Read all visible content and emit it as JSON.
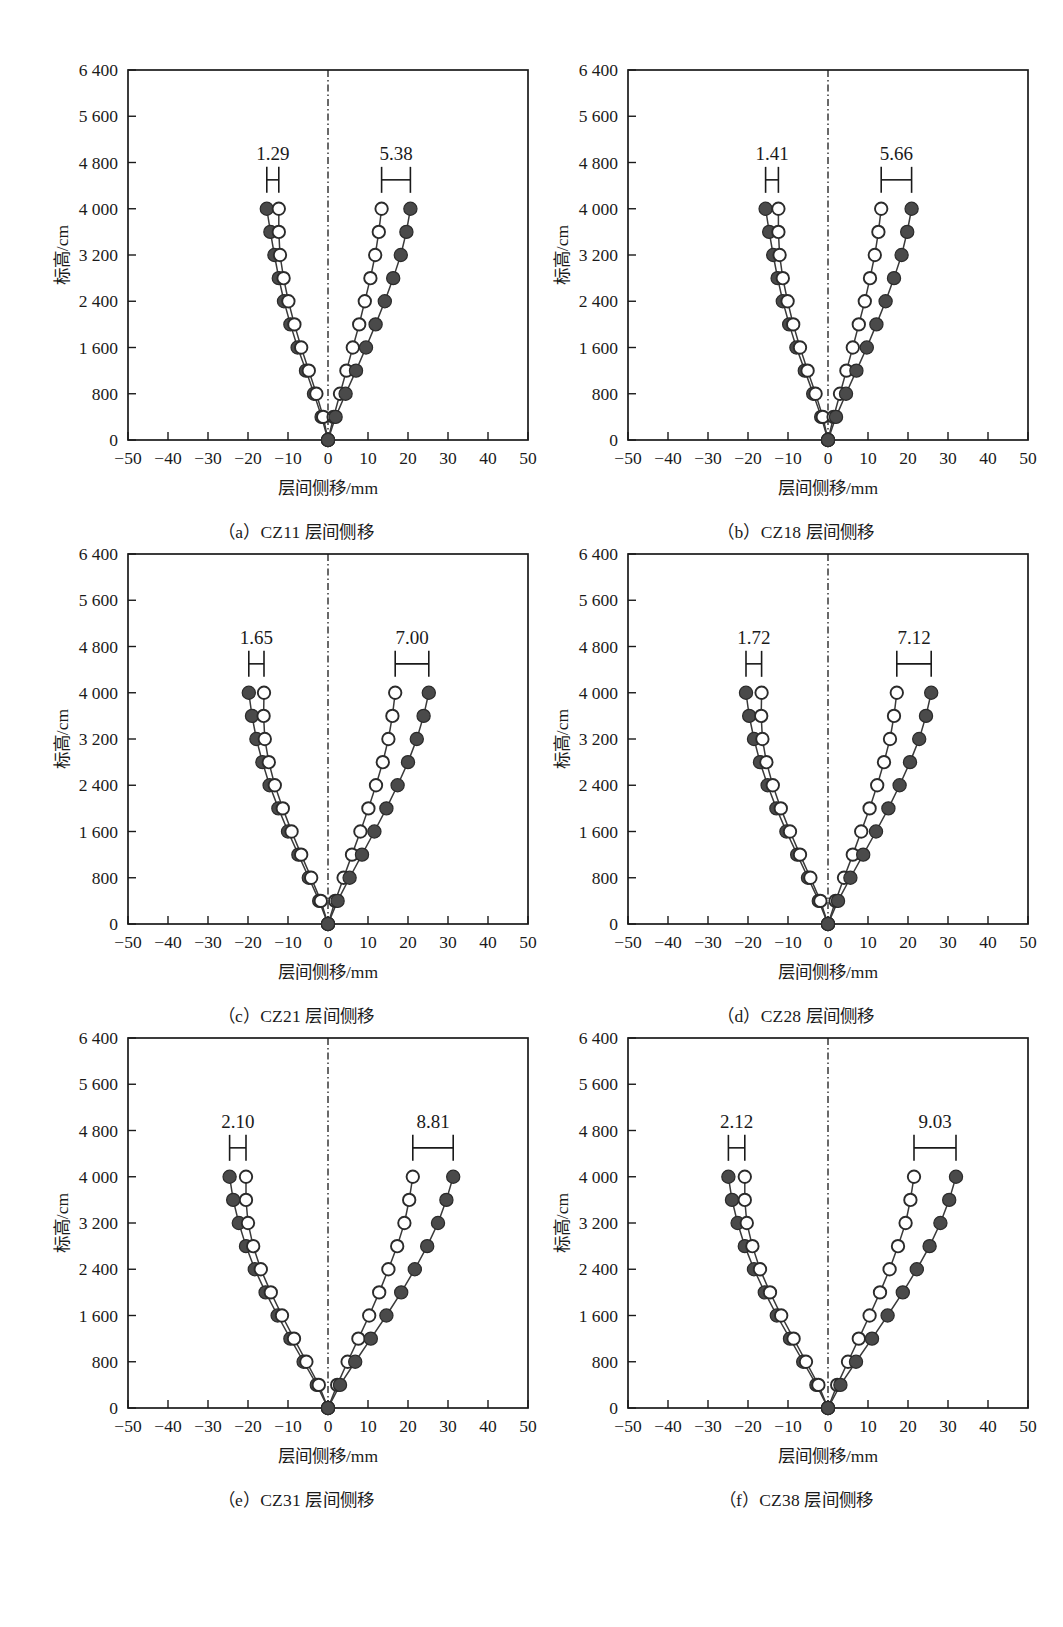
{
  "figure": {
    "axis": {
      "xlabel": "层间侧移/mm",
      "ylabel": "标高/cm",
      "xticks": [
        "−50",
        "−40",
        "−30",
        "−20",
        "−10",
        "0",
        "10",
        "20",
        "30",
        "40",
        "50"
      ],
      "xtickvals": [
        -50,
        -40,
        -30,
        -20,
        -10,
        0,
        10,
        20,
        30,
        40,
        50
      ],
      "yticks": [
        "0",
        "800",
        "1 600",
        "2 400",
        "3 200",
        "4 000",
        "4 800",
        "5 600",
        "6 400"
      ],
      "ytickvals": [
        0,
        800,
        1600,
        2400,
        3200,
        4000,
        4800,
        5600,
        6400
      ],
      "xlim": [
        -50,
        50
      ],
      "ylim": [
        0,
        6400
      ]
    },
    "panels": [
      {
        "key": "a",
        "caption": "（a）CZ11 层间侧移"
      },
      {
        "key": "b",
        "caption": "（b）CZ18 层间侧移"
      },
      {
        "key": "c",
        "caption": "（c）CZ21 层间侧移"
      },
      {
        "key": "d",
        "caption": "（d）CZ28 层间侧移"
      },
      {
        "key": "e",
        "caption": "（e）CZ31 层间侧移"
      },
      {
        "key": "f",
        "caption": "（f）CZ38 层间侧移"
      }
    ]
  },
  "chart_data": [
    {
      "type": "line",
      "panel": "a",
      "title": "（a）CZ11 层间侧移",
      "xlabel": "层间侧移/mm",
      "ylabel": "标高/cm",
      "xlim": [
        -50,
        50
      ],
      "ylim": [
        0,
        6400
      ],
      "grid": false,
      "legend": "none",
      "elevations": [
        0,
        400,
        800,
        1200,
        1600,
        2000,
        2400,
        2800,
        3200,
        3600,
        4000
      ],
      "annotations": [
        {
          "label": "1.29",
          "side": "left",
          "x_from": -15.3,
          "x_to": -12.3,
          "y": 4500
        },
        {
          "label": "5.38",
          "side": "right",
          "x_from": 13.4,
          "x_to": 20.6,
          "y": 4500
        }
      ],
      "series": [
        {
          "name": "filled-negative",
          "marker": "filled",
          "x": [
            0,
            -1.6,
            -3.5,
            -5.5,
            -7.6,
            -9.4,
            -11.0,
            -12.3,
            -13.4,
            -14.4,
            -15.3
          ],
          "y": [
            0,
            400,
            800,
            1200,
            1600,
            2000,
            2400,
            2800,
            3200,
            3600,
            4000
          ]
        },
        {
          "name": "hollow-negative",
          "marker": "hollow",
          "x": [
            0,
            -1.2,
            -2.9,
            -4.8,
            -6.7,
            -8.4,
            -9.9,
            -11.1,
            -12.0,
            -12.3,
            -12.3
          ],
          "y": [
            0,
            400,
            800,
            1200,
            1600,
            2000,
            2400,
            2800,
            3200,
            3600,
            4000
          ]
        },
        {
          "name": "hollow-positive",
          "marker": "hollow",
          "x": [
            0,
            1.4,
            3.0,
            4.6,
            6.2,
            7.8,
            9.2,
            10.6,
            11.8,
            12.7,
            13.4
          ],
          "y": [
            0,
            400,
            800,
            1200,
            1600,
            2000,
            2400,
            2800,
            3200,
            3600,
            4000
          ]
        },
        {
          "name": "filled-positive",
          "marker": "filled",
          "x": [
            0,
            1.9,
            4.4,
            7.0,
            9.5,
            11.9,
            14.2,
            16.3,
            18.2,
            19.6,
            20.6
          ],
          "y": [
            0,
            400,
            800,
            1200,
            1600,
            2000,
            2400,
            2800,
            3200,
            3600,
            4000
          ]
        }
      ]
    },
    {
      "type": "line",
      "panel": "b",
      "title": "（b）CZ18 层间侧移",
      "xlabel": "层间侧移/mm",
      "ylabel": "标高/cm",
      "xlim": [
        -50,
        50
      ],
      "ylim": [
        0,
        6400
      ],
      "grid": false,
      "legend": "none",
      "elevations": [
        0,
        400,
        800,
        1200,
        1600,
        2000,
        2400,
        2800,
        3200,
        3600,
        4000
      ],
      "annotations": [
        {
          "label": "1.41",
          "side": "left",
          "x_from": -15.6,
          "x_to": -12.4,
          "y": 4500
        },
        {
          "label": "5.66",
          "side": "right",
          "x_from": 13.3,
          "x_to": 20.9,
          "y": 4500
        }
      ],
      "series": [
        {
          "name": "filled-negative",
          "marker": "filled",
          "x": [
            0,
            -1.7,
            -3.7,
            -5.8,
            -7.9,
            -9.7,
            -11.3,
            -12.6,
            -13.7,
            -14.7,
            -15.6
          ],
          "y": [
            0,
            400,
            800,
            1200,
            1600,
            2000,
            2400,
            2800,
            3200,
            3600,
            4000
          ]
        },
        {
          "name": "hollow-negative",
          "marker": "hollow",
          "x": [
            0,
            -1.3,
            -3.1,
            -5.1,
            -7.0,
            -8.7,
            -10.1,
            -11.3,
            -12.1,
            -12.4,
            -12.4
          ],
          "y": [
            0,
            400,
            800,
            1200,
            1600,
            2000,
            2400,
            2800,
            3200,
            3600,
            4000
          ]
        },
        {
          "name": "hollow-positive",
          "marker": "hollow",
          "x": [
            0,
            1.4,
            3.0,
            4.6,
            6.2,
            7.7,
            9.2,
            10.5,
            11.7,
            12.6,
            13.3
          ],
          "y": [
            0,
            400,
            800,
            1200,
            1600,
            2000,
            2400,
            2800,
            3200,
            3600,
            4000
          ]
        },
        {
          "name": "filled-positive",
          "marker": "filled",
          "x": [
            0,
            2.0,
            4.5,
            7.1,
            9.7,
            12.1,
            14.4,
            16.5,
            18.4,
            19.8,
            20.9
          ],
          "y": [
            0,
            400,
            800,
            1200,
            1600,
            2000,
            2400,
            2800,
            3200,
            3600,
            4000
          ]
        }
      ]
    },
    {
      "type": "line",
      "panel": "c",
      "title": "（c）CZ21 层间侧移",
      "xlabel": "层间侧移/mm",
      "ylabel": "标高/cm",
      "xlim": [
        -50,
        50
      ],
      "ylim": [
        0,
        6400
      ],
      "grid": false,
      "legend": "none",
      "elevations": [
        0,
        400,
        800,
        1200,
        1600,
        2000,
        2400,
        2800,
        3200,
        3600,
        4000
      ],
      "annotations": [
        {
          "label": "1.65",
          "side": "left",
          "x_from": -19.8,
          "x_to": -16.0,
          "y": 4500
        },
        {
          "label": "7.00",
          "side": "right",
          "x_from": 16.8,
          "x_to": 25.2,
          "y": 4500
        }
      ],
      "series": [
        {
          "name": "filled-negative",
          "marker": "filled",
          "x": [
            0,
            -2.2,
            -4.8,
            -7.4,
            -10.0,
            -12.4,
            -14.6,
            -16.4,
            -17.9,
            -19.0,
            -19.8
          ],
          "y": [
            0,
            400,
            800,
            1200,
            1600,
            2000,
            2400,
            2800,
            3200,
            3600,
            4000
          ]
        },
        {
          "name": "hollow-negative",
          "marker": "hollow",
          "x": [
            0,
            -1.8,
            -4.2,
            -6.7,
            -9.1,
            -11.3,
            -13.3,
            -14.8,
            -15.8,
            -16.1,
            -16.0
          ],
          "y": [
            0,
            400,
            800,
            1200,
            1600,
            2000,
            2400,
            2800,
            3200,
            3600,
            4000
          ]
        },
        {
          "name": "hollow-positive",
          "marker": "hollow",
          "x": [
            0,
            1.8,
            3.9,
            6.0,
            8.1,
            10.1,
            12.0,
            13.7,
            15.1,
            16.1,
            16.8
          ],
          "y": [
            0,
            400,
            800,
            1200,
            1600,
            2000,
            2400,
            2800,
            3200,
            3600,
            4000
          ]
        },
        {
          "name": "filled-positive",
          "marker": "filled",
          "x": [
            0,
            2.4,
            5.4,
            8.5,
            11.6,
            14.6,
            17.4,
            20.0,
            22.2,
            23.9,
            25.2
          ],
          "y": [
            0,
            400,
            800,
            1200,
            1600,
            2000,
            2400,
            2800,
            3200,
            3600,
            4000
          ]
        }
      ]
    },
    {
      "type": "line",
      "panel": "d",
      "title": "（d）CZ28 层间侧移",
      "xlabel": "层间侧移/mm",
      "ylabel": "标高/cm",
      "xlim": [
        -50,
        50
      ],
      "ylim": [
        0,
        6400
      ],
      "grid": false,
      "legend": "none",
      "elevations": [
        0,
        400,
        800,
        1200,
        1600,
        2000,
        2400,
        2800,
        3200,
        3600,
        4000
      ],
      "annotations": [
        {
          "label": "1.72",
          "side": "left",
          "x_from": -20.5,
          "x_to": -16.6,
          "y": 4500
        },
        {
          "label": "7.12",
          "side": "right",
          "x_from": 17.2,
          "x_to": 25.8,
          "y": 4500
        }
      ],
      "series": [
        {
          "name": "filled-negative",
          "marker": "filled",
          "x": [
            0,
            -2.3,
            -5.0,
            -7.7,
            -10.4,
            -12.9,
            -15.1,
            -17.0,
            -18.5,
            -19.7,
            -20.5
          ],
          "y": [
            0,
            400,
            800,
            1200,
            1600,
            2000,
            2400,
            2800,
            3200,
            3600,
            4000
          ]
        },
        {
          "name": "hollow-negative",
          "marker": "hollow",
          "x": [
            0,
            -1.9,
            -4.4,
            -7.0,
            -9.5,
            -11.8,
            -13.8,
            -15.4,
            -16.4,
            -16.7,
            -16.6
          ],
          "y": [
            0,
            400,
            800,
            1200,
            1600,
            2000,
            2400,
            2800,
            3200,
            3600,
            4000
          ]
        },
        {
          "name": "hollow-positive",
          "marker": "hollow",
          "x": [
            0,
            1.9,
            4.0,
            6.2,
            8.3,
            10.4,
            12.3,
            14.0,
            15.5,
            16.5,
            17.2
          ],
          "y": [
            0,
            400,
            800,
            1200,
            1600,
            2000,
            2400,
            2800,
            3200,
            3600,
            4000
          ]
        },
        {
          "name": "filled-positive",
          "marker": "filled",
          "x": [
            0,
            2.5,
            5.6,
            8.8,
            12.0,
            15.1,
            17.9,
            20.5,
            22.8,
            24.5,
            25.8
          ],
          "y": [
            0,
            400,
            800,
            1200,
            1600,
            2000,
            2400,
            2800,
            3200,
            3600,
            4000
          ]
        }
      ]
    },
    {
      "type": "line",
      "panel": "e",
      "title": "（e）CZ31 层间侧移",
      "xlabel": "层间侧移/mm",
      "ylabel": "标高/cm",
      "xlim": [
        -50,
        50
      ],
      "ylim": [
        0,
        6400
      ],
      "grid": false,
      "legend": "none",
      "elevations": [
        0,
        400,
        800,
        1200,
        1600,
        2000,
        2400,
        2800,
        3200,
        3600,
        4000
      ],
      "annotations": [
        {
          "label": "2.10",
          "side": "left",
          "x_from": -24.6,
          "x_to": -20.5,
          "y": 4500
        },
        {
          "label": "8.81",
          "side": "right",
          "x_from": 21.2,
          "x_to": 31.3,
          "y": 4500
        }
      ],
      "series": [
        {
          "name": "filled-negative",
          "marker": "filled",
          "x": [
            0,
            -2.8,
            -6.1,
            -9.4,
            -12.6,
            -15.6,
            -18.3,
            -20.5,
            -22.3,
            -23.7,
            -24.6
          ],
          "y": [
            0,
            400,
            800,
            1200,
            1600,
            2000,
            2400,
            2800,
            3200,
            3600,
            4000
          ]
        },
        {
          "name": "hollow-negative",
          "marker": "hollow",
          "x": [
            0,
            -2.3,
            -5.4,
            -8.5,
            -11.5,
            -14.3,
            -16.8,
            -18.7,
            -20.0,
            -20.5,
            -20.5
          ],
          "y": [
            0,
            400,
            800,
            1200,
            1600,
            2000,
            2400,
            2800,
            3200,
            3600,
            4000
          ]
        },
        {
          "name": "hollow-positive",
          "marker": "hollow",
          "x": [
            0,
            2.3,
            4.9,
            7.6,
            10.3,
            12.8,
            15.1,
            17.3,
            19.1,
            20.3,
            21.2
          ],
          "y": [
            0,
            400,
            800,
            1200,
            1600,
            2000,
            2400,
            2800,
            3200,
            3600,
            4000
          ]
        },
        {
          "name": "filled-positive",
          "marker": "filled",
          "x": [
            0,
            3.0,
            6.8,
            10.7,
            14.6,
            18.3,
            21.7,
            24.8,
            27.5,
            29.6,
            31.3
          ],
          "y": [
            0,
            400,
            800,
            1200,
            1600,
            2000,
            2400,
            2800,
            3200,
            3600,
            4000
          ]
        }
      ]
    },
    {
      "type": "line",
      "panel": "f",
      "title": "（f）CZ38 层间侧移",
      "xlabel": "层间侧移/mm",
      "ylabel": "标高/cm",
      "xlim": [
        -50,
        50
      ],
      "ylim": [
        0,
        6400
      ],
      "grid": false,
      "legend": "none",
      "elevations": [
        0,
        400,
        800,
        1200,
        1600,
        2000,
        2400,
        2800,
        3200,
        3600,
        4000
      ],
      "annotations": [
        {
          "label": "2.12",
          "side": "left",
          "x_from": -24.9,
          "x_to": -20.8,
          "y": 4500
        },
        {
          "label": "9.03",
          "side": "right",
          "x_from": 21.5,
          "x_to": 32.0,
          "y": 4500
        }
      ],
      "series": [
        {
          "name": "filled-negative",
          "marker": "filled",
          "x": [
            0,
            -2.9,
            -6.2,
            -9.5,
            -12.8,
            -15.8,
            -18.5,
            -20.8,
            -22.6,
            -24.0,
            -24.9
          ],
          "y": [
            0,
            400,
            800,
            1200,
            1600,
            2000,
            2400,
            2800,
            3200,
            3600,
            4000
          ]
        },
        {
          "name": "hollow-negative",
          "marker": "hollow",
          "x": [
            0,
            -2.4,
            -5.5,
            -8.6,
            -11.7,
            -14.5,
            -17.0,
            -18.9,
            -20.3,
            -20.8,
            -20.8
          ],
          "y": [
            0,
            400,
            800,
            1200,
            1600,
            2000,
            2400,
            2800,
            3200,
            3600,
            4000
          ]
        },
        {
          "name": "hollow-positive",
          "marker": "hollow",
          "x": [
            0,
            2.3,
            5.0,
            7.7,
            10.4,
            13.0,
            15.4,
            17.5,
            19.4,
            20.6,
            21.5
          ],
          "y": [
            0,
            400,
            800,
            1200,
            1600,
            2000,
            2400,
            2800,
            3200,
            3600,
            4000
          ]
        },
        {
          "name": "filled-positive",
          "marker": "filled",
          "x": [
            0,
            3.1,
            7.0,
            11.0,
            14.9,
            18.7,
            22.2,
            25.4,
            28.1,
            30.3,
            32.0
          ],
          "y": [
            0,
            400,
            800,
            1200,
            1600,
            2000,
            2400,
            2800,
            3200,
            3600,
            4000
          ]
        }
      ]
    }
  ]
}
